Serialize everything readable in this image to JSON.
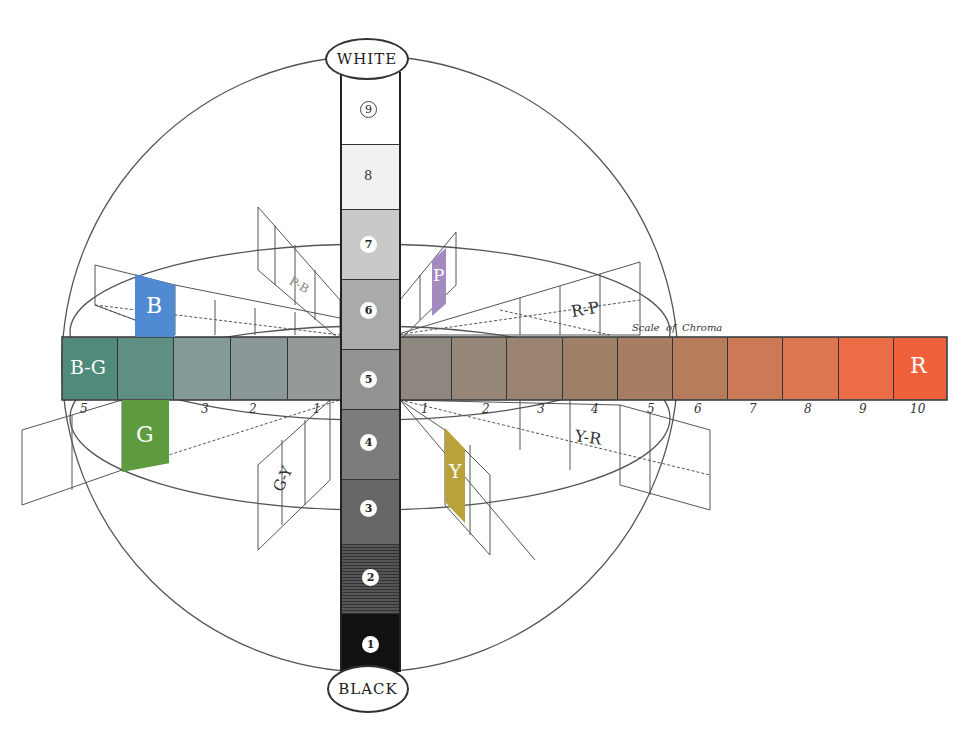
{
  "diagram": {
    "value_axis": {
      "top_label": "WHITE",
      "bottom_label": "BLACK",
      "steps": [
        {
          "value": "9",
          "color": "#ffffff"
        },
        {
          "value": "8",
          "color": "#f1f1f1"
        },
        {
          "value": "7",
          "color": "#c9c9c9"
        },
        {
          "value": "6",
          "color": "#aaaaaa"
        },
        {
          "value": "5",
          "color": "#939393"
        },
        {
          "value": "4",
          "color": "#7c7c7c"
        },
        {
          "value": "3",
          "color": "#666666"
        },
        {
          "value": "2",
          "color": "#474747"
        },
        {
          "value": "1",
          "color": "#111111"
        }
      ]
    },
    "chroma_scale": {
      "label_word1": "Scale",
      "label_word2": "of",
      "label_word3": "Chroma",
      "right_hue": "R",
      "left_hue": "B-G",
      "right_numbers": [
        "1",
        "2",
        "3",
        "4",
        "5",
        "6",
        "7",
        "8",
        "9",
        "10"
      ],
      "left_numbers": [
        "1",
        "2",
        "3",
        "5"
      ],
      "right_colors": [
        "#8d8780",
        "#958677",
        "#9a8370",
        "#a07f68",
        "#a77e64",
        "#b77c5c",
        "#cc7a56",
        "#dd7650",
        "#ec6d45",
        "#f0603a"
      ],
      "left_colors": [
        "#939a98",
        "#8a9997",
        "#849a96",
        "#5f8e82",
        "#4f8a7a"
      ]
    },
    "hue_planes": [
      {
        "label": "B",
        "color": "#4f8ad2",
        "filled": true
      },
      {
        "label": "P",
        "color": "#a58ac0",
        "filled": true
      },
      {
        "label": "P-B",
        "filled": false
      },
      {
        "label": "R-P",
        "filled": false
      },
      {
        "label": "G",
        "color": "#5e9a3e",
        "filled": true
      },
      {
        "label": "Y",
        "color": "#b9a23a",
        "filled": true
      },
      {
        "label": "G-Y",
        "filled": false
      },
      {
        "label": "Y-R",
        "filled": false
      }
    ]
  }
}
